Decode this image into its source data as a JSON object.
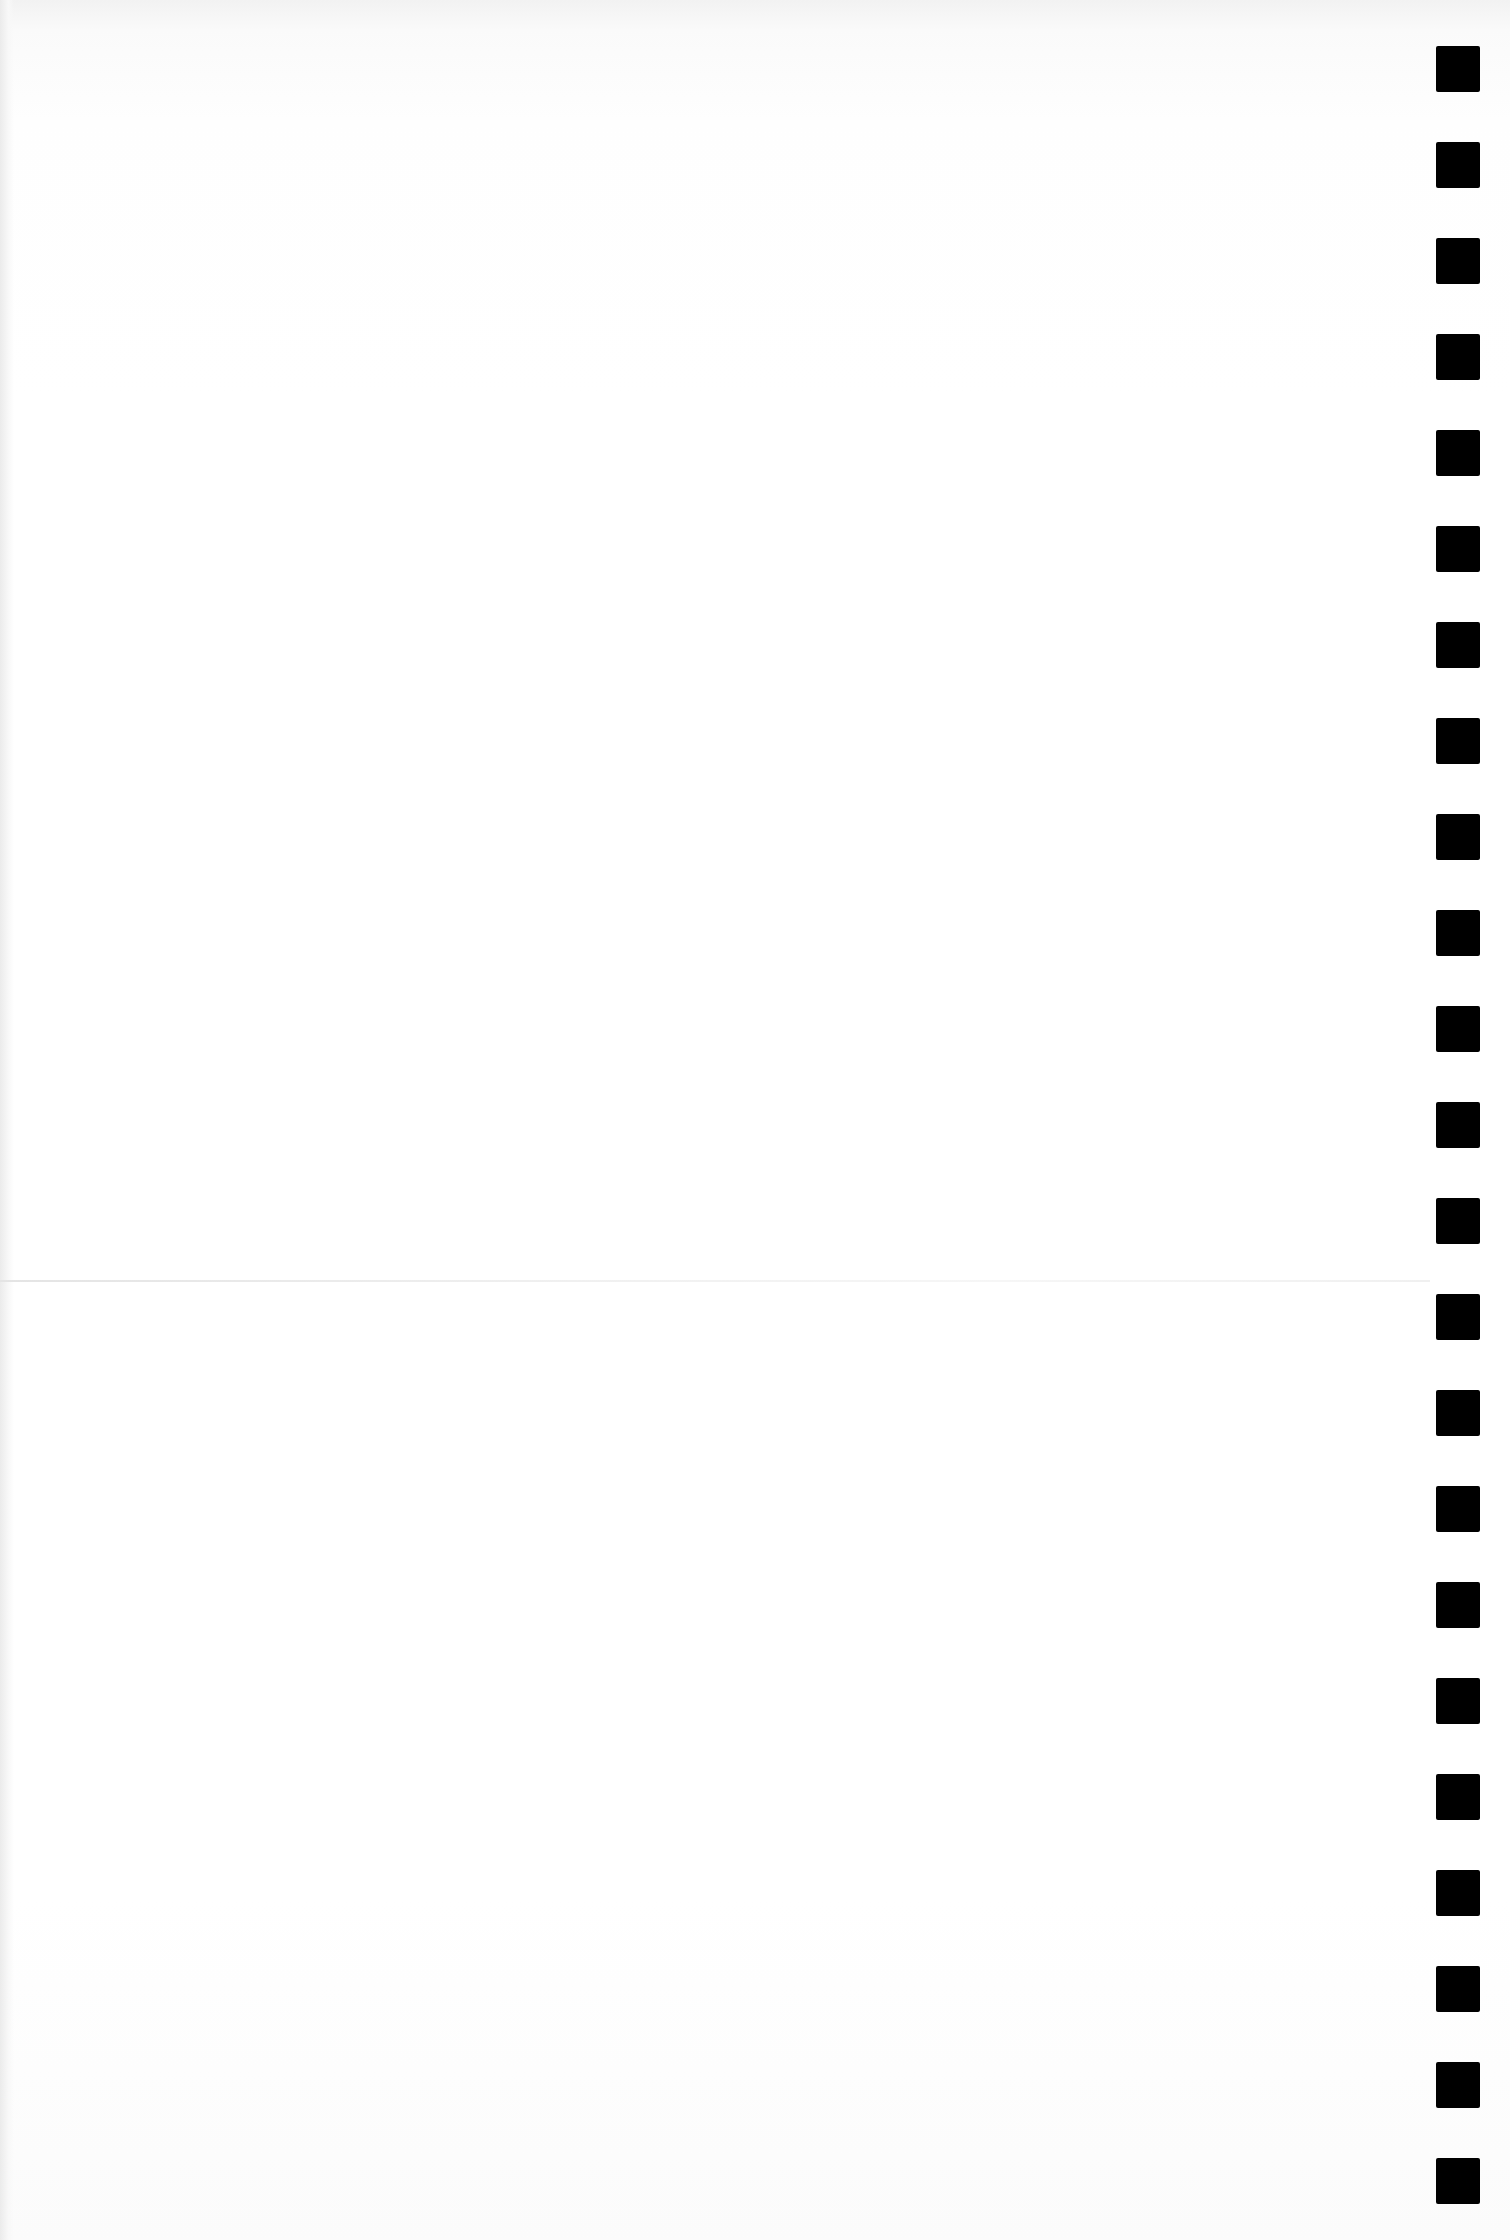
{
  "document": {
    "type": "scanned blank page",
    "header_bleed_text": "",
    "faint_line_text": "",
    "corner_text": ""
  },
  "registration_marks": {
    "count": 23,
    "color": "#000000",
    "items": [
      {
        "id": 1
      },
      {
        "id": 2
      },
      {
        "id": 3
      },
      {
        "id": 4
      },
      {
        "id": 5
      },
      {
        "id": 6
      },
      {
        "id": 7
      },
      {
        "id": 8
      },
      {
        "id": 9
      },
      {
        "id": 10
      },
      {
        "id": 11
      },
      {
        "id": 12
      },
      {
        "id": 13
      },
      {
        "id": 14
      },
      {
        "id": 15
      },
      {
        "id": 16
      },
      {
        "id": 17
      },
      {
        "id": 18
      },
      {
        "id": 19
      },
      {
        "id": 20
      },
      {
        "id": 21
      },
      {
        "id": 22
      },
      {
        "id": 23
      }
    ]
  },
  "colors": {
    "paper": "#ffffff",
    "mark": "#000000",
    "fold": "#e4e4e4"
  }
}
